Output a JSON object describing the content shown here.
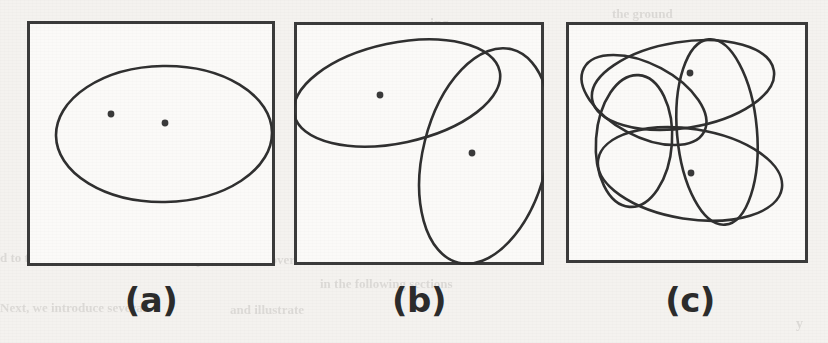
{
  "figure": {
    "background_color": "#f4f2ef",
    "panel_fill_color": "#fbfaf8",
    "stroke_color": "#303030",
    "box_border_color": "#3b3b3b",
    "dot_color": "#3a3a3a"
  },
  "panels": [
    {
      "id": "a",
      "caption": "(a)",
      "box": {
        "x": 27,
        "y": 21,
        "width": 248,
        "height": 245
      },
      "caption_center_x": 151,
      "caption_y": 283,
      "ellipse_count": 1,
      "point_count": 2,
      "ellipses": [
        {
          "cx": 137,
          "cy": 113,
          "rx": 108,
          "ry": 68,
          "rotation": -1
        }
      ],
      "points": [
        {
          "x": 84,
          "y": 93
        },
        {
          "x": 138,
          "y": 102
        }
      ]
    },
    {
      "id": "b",
      "caption": "(b)",
      "box": {
        "x": 294,
        "y": 22,
        "width": 250,
        "height": 243
      },
      "caption_center_x": 419,
      "caption_y": 283,
      "ellipse_count": 2,
      "point_count": 2,
      "ellipses": [
        {
          "cx": 103,
          "cy": 71,
          "rx": 105,
          "ry": 50,
          "rotation": -12
        },
        {
          "cx": 191,
          "cy": 134,
          "rx": 62,
          "ry": 110,
          "rotation": 14
        }
      ],
      "points": [
        {
          "x": 86,
          "y": 73
        },
        {
          "x": 178,
          "y": 131
        }
      ]
    },
    {
      "id": "c",
      "caption": "(c)",
      "box": {
        "x": 566,
        "y": 22,
        "width": 242,
        "height": 241
      },
      "caption_center_x": 690,
      "caption_y": 283,
      "ellipse_count": 4,
      "point_count": 2,
      "ellipses": [
        {
          "cx": 117,
          "cy": 63,
          "rx": 92,
          "ry": 43,
          "rotation": -9
        },
        {
          "cx": 78,
          "cy": 78,
          "rx": 68,
          "ry": 36,
          "rotation": 28
        },
        {
          "cx": 124,
          "cy": 152,
          "rx": 93,
          "ry": 45,
          "rotation": 9
        },
        {
          "cx": 151,
          "cy": 110,
          "rx": 40,
          "ry": 93,
          "rotation": -5
        },
        {
          "cx": 68,
          "cy": 119,
          "rx": 38,
          "ry": 66,
          "rotation": 4
        }
      ],
      "points": [
        {
          "x": 124,
          "y": 51
        },
        {
          "x": 125,
          "y": 151
        }
      ]
    }
  ],
  "bleed_through_text": [
    {
      "text": "the ground",
      "x": 612,
      "y": 6,
      "size": 13,
      "rotate": 0
    },
    {
      "text": "ing",
      "x": 430,
      "y": 16,
      "size": 14,
      "rotate": 0
    },
    {
      "text": "to ensure",
      "x": 585,
      "y": 28,
      "size": 13,
      "rotate": 0
    },
    {
      "text": "one of the",
      "x": 305,
      "y": 70,
      "size": 13,
      "rotate": 0
    },
    {
      "text": "ering",
      "x": 345,
      "y": 118,
      "size": 13,
      "rotate": 0
    },
    {
      "text": "Nevertheless",
      "x": 570,
      "y": 190,
      "size": 15,
      "rotate": 0
    },
    {
      "text": "d to this. Similarly",
      "x": 0,
      "y": 250,
      "size": 13,
      "rotate": 0
    },
    {
      "text": "We presented an overview",
      "x": 175,
      "y": 252,
      "size": 13,
      "rotate": 0
    },
    {
      "text": "in the following sections",
      "x": 320,
      "y": 276,
      "size": 13,
      "rotate": 0
    },
    {
      "text": "Next, we introduce several",
      "x": 0,
      "y": 300,
      "size": 13,
      "rotate": 0
    },
    {
      "text": "and illustrate",
      "x": 230,
      "y": 302,
      "size": 13,
      "rotate": 0
    },
    {
      "text": "y",
      "x": 796,
      "y": 316,
      "size": 14,
      "rotate": 0
    }
  ]
}
